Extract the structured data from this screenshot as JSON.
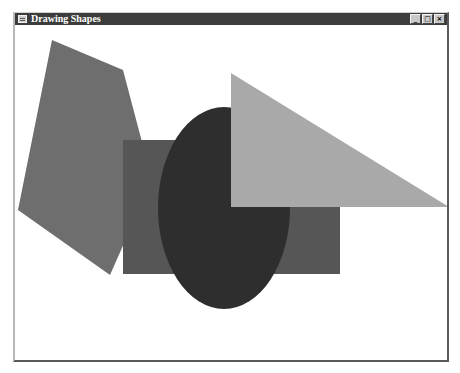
{
  "window": {
    "title": "Drawing Shapes",
    "icon": "app-window-icon",
    "controls": {
      "minimize": "_",
      "maximize": "□",
      "close": "×"
    }
  },
  "canvas": {
    "background": "#ffffff",
    "shapes": [
      {
        "type": "polygon",
        "name": "pentagon",
        "color": "#6e6e6e",
        "points": "37,15 108,45 137,155 95,250 3,185"
      },
      {
        "type": "rectangle",
        "name": "rectangle",
        "color": "#565656",
        "x": 108,
        "y": 115,
        "width": 217,
        "height": 134
      },
      {
        "type": "ellipse",
        "name": "ellipse",
        "color": "#2e2e2e",
        "cx": 209,
        "cy": 183,
        "rx": 66,
        "ry": 101
      },
      {
        "type": "polygon",
        "name": "triangle",
        "color": "#a9a9a9",
        "points": "216,48 216,182 434,182"
      }
    ]
  }
}
